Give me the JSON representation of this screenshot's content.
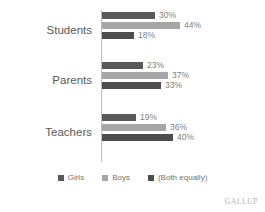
{
  "chart_data": {
    "type": "bar",
    "orientation": "horizontal",
    "title": "",
    "xlabel": "",
    "ylabel": "",
    "categories": [
      "Students",
      "Parents",
      "Teachers"
    ],
    "series": [
      {
        "name": "Girls",
        "color": "#595959",
        "values": [
          30,
          44,
          18
        ]
      },
      {
        "name": "Boys",
        "color": "#a6a6a6",
        "values": [
          23,
          37,
          33
        ]
      },
      {
        "name": "(Both equally)",
        "color": "#4d4d4d",
        "values": [
          19,
          36,
          40
        ]
      }
    ],
    "groups": [
      {
        "category": "Students",
        "bars": [
          {
            "series": "Girls",
            "value": 30,
            "label": "30%",
            "color": "#595959"
          },
          {
            "series": "Boys",
            "value": 44,
            "label": "44%",
            "color": "#a6a6a6"
          },
          {
            "series": "(Both equally)",
            "value": 18,
            "label": "18%",
            "color": "#4d4d4d"
          }
        ]
      },
      {
        "category": "Parents",
        "bars": [
          {
            "series": "Girls",
            "value": 23,
            "label": "23%",
            "color": "#595959"
          },
          {
            "series": "Boys",
            "value": 37,
            "label": "37%",
            "color": "#a6a6a6"
          },
          {
            "series": "(Both equally)",
            "value": 33,
            "label": "33%",
            "color": "#4d4d4d"
          }
        ]
      },
      {
        "category": "Teachers",
        "bars": [
          {
            "series": "Girls",
            "value": 19,
            "label": "19%",
            "color": "#595959"
          },
          {
            "series": "Boys",
            "value": 36,
            "label": "36%",
            "color": "#a6a6a6"
          },
          {
            "series": "(Both equally)",
            "value": 40,
            "label": "40%",
            "color": "#4d4d4d"
          }
        ]
      }
    ],
    "xlim": [
      0,
      50
    ],
    "grid": false,
    "legend_position": "bottom",
    "value_labels": true
  },
  "legend": {
    "items": [
      {
        "label": "Girls",
        "color": "#595959"
      },
      {
        "label": "Boys",
        "color": "#a6a6a6"
      },
      {
        "label": "(Both equally)",
        "color": "#4d4d4d"
      }
    ]
  },
  "brand": {
    "text": "GALLUP"
  },
  "axis": {
    "line_color": "#bfbfbf"
  }
}
